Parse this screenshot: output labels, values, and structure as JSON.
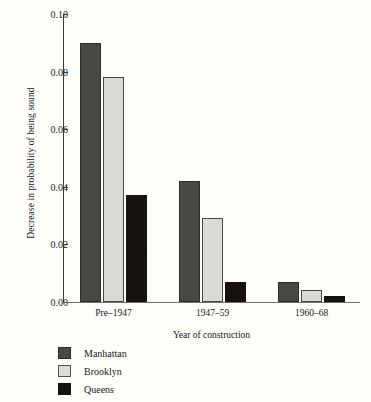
{
  "chart_data": {
    "type": "bar",
    "title": "",
    "xlabel": "Year of construction",
    "ylabel": "Decrease in probability of being sound",
    "categories": [
      "Pre–1947",
      "1947–59",
      "1960–68"
    ],
    "series": [
      {
        "name": "Manhattan",
        "color": "#4a4845",
        "values": [
          0.09,
          0.042,
          0.007
        ]
      },
      {
        "name": "Brooklyn",
        "color": "#d9d9d5",
        "values": [
          0.078,
          0.029,
          0.004
        ]
      },
      {
        "name": "Queens",
        "color": "#17120e",
        "values": [
          0.037,
          0.007,
          0.002
        ]
      }
    ],
    "ylim": [
      0.0,
      0.1
    ],
    "ytick_labels": [
      "0.00",
      "0.02",
      "0.04",
      "0.06",
      "0.08",
      "0.10"
    ],
    "ytick_values": [
      0.0,
      0.02,
      0.04,
      0.06,
      0.08,
      0.1
    ],
    "grid": false,
    "legend_position": "below-left"
  },
  "legend": {
    "items": [
      {
        "label": "Manhattan",
        "swatch": "manhattan"
      },
      {
        "label": "Brooklyn",
        "swatch": "brooklyn"
      },
      {
        "label": "Queens",
        "swatch": "queens"
      }
    ]
  }
}
